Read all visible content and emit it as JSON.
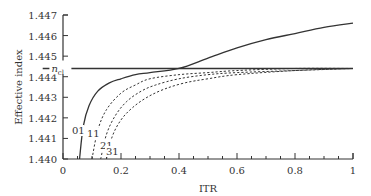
{
  "chart_data": {
    "type": "line",
    "title": "",
    "xlabel": "ITR",
    "ylabel": "Effective index",
    "xlim": [
      0,
      1
    ],
    "ylim": [
      1.44,
      1.447
    ],
    "xticks": [
      "0",
      "0.2",
      "0.4",
      "0.6",
      "0.8",
      "1"
    ],
    "yticks": [
      "1.440",
      "1.441",
      "1.442",
      "1.443",
      "1.444",
      "1.445",
      "1.446",
      "1.447"
    ],
    "grid": false,
    "legend": "none",
    "annotations": [
      {
        "text": "n",
        "subscript": "cl",
        "label": "n_cl",
        "x": 0.02,
        "y": 1.4444
      },
      {
        "text": "01",
        "x": 0.05,
        "y": 1.4419
      },
      {
        "text": "11",
        "x": 0.1,
        "y": 1.4416
      },
      {
        "text": "21",
        "x": 0.13,
        "y": 1.4411
      },
      {
        "text": "31",
        "x": 0.15,
        "y": 1.4405
      }
    ],
    "series": [
      {
        "name": "n_cl",
        "style": "solid",
        "x": [
          0.0,
          1.0
        ],
        "y": [
          1.4444,
          1.4444
        ]
      },
      {
        "name": "01",
        "style": "solid",
        "x": [
          0.057,
          0.07,
          0.09,
          0.12,
          0.16,
          0.2,
          0.25,
          0.3,
          0.4,
          0.5,
          0.6,
          0.7,
          0.8,
          0.9,
          1.0
        ],
        "y": [
          1.44,
          1.4416,
          1.4426,
          1.4433,
          1.4437,
          1.4439,
          1.4441,
          1.4442,
          1.4444,
          1.4449,
          1.4454,
          1.4458,
          1.4461,
          1.4464,
          1.4466
        ]
      },
      {
        "name": "11",
        "style": "dotted",
        "x": [
          0.1,
          0.12,
          0.15,
          0.2,
          0.25,
          0.3,
          0.4,
          0.5,
          0.6,
          0.8,
          1.0
        ],
        "y": [
          1.44,
          1.4414,
          1.4424,
          1.4432,
          1.4436,
          1.4439,
          1.4441,
          1.4442,
          1.4443,
          1.4444,
          1.4444
        ]
      },
      {
        "name": "21",
        "style": "dotted",
        "x": [
          0.13,
          0.15,
          0.18,
          0.22,
          0.27,
          0.32,
          0.4,
          0.5,
          0.6,
          0.8,
          1.0
        ],
        "y": [
          1.44,
          1.4412,
          1.4421,
          1.4428,
          1.4433,
          1.4436,
          1.4439,
          1.4441,
          1.4442,
          1.4443,
          1.4444
        ]
      },
      {
        "name": "31",
        "style": "dotted",
        "x": [
          0.15,
          0.17,
          0.2,
          0.24,
          0.29,
          0.35,
          0.42,
          0.5,
          0.6,
          0.8,
          1.0
        ],
        "y": [
          1.44,
          1.4411,
          1.4419,
          1.4425,
          1.443,
          1.4434,
          1.4437,
          1.4439,
          1.4441,
          1.4443,
          1.4444
        ]
      }
    ]
  }
}
